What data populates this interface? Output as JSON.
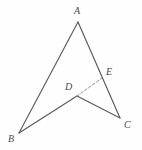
{
  "figure": {
    "type": "geometry-diagram",
    "canvas": {
      "width": 142,
      "height": 150
    },
    "background_color": "#fefefe",
    "stroke_color": "#5a5a5f",
    "dash_color": "#8a8a90",
    "label_color": "#4a4a4a",
    "points": [
      {
        "id": "A",
        "label": "A",
        "x": 78,
        "y": 22,
        "label_x": 74,
        "label_y": 6
      },
      {
        "id": "B",
        "label": "B",
        "x": 19,
        "y": 133,
        "label_x": 8,
        "label_y": 134
      },
      {
        "id": "C",
        "label": "C",
        "x": 120,
        "y": 118,
        "label_x": 124,
        "label_y": 120
      },
      {
        "id": "D",
        "label": "D",
        "x": 77,
        "y": 96,
        "label_x": 65,
        "label_y": 82
      },
      {
        "id": "E",
        "label": "E",
        "x": 102,
        "y": 78,
        "label_x": 106,
        "label_y": 67
      }
    ],
    "segments": [
      {
        "id": "AB",
        "from": "A",
        "to": "B",
        "style": "solid"
      },
      {
        "id": "AC",
        "from": "A",
        "to": "C",
        "style": "solid"
      },
      {
        "id": "BD",
        "from": "B",
        "to": "D",
        "style": "solid"
      },
      {
        "id": "DC",
        "from": "D",
        "to": "C",
        "style": "solid"
      },
      {
        "id": "DE",
        "from": "D",
        "to": "E",
        "style": "dashed"
      }
    ]
  }
}
